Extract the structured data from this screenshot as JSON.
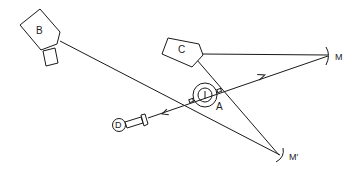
{
  "diagram": {
    "title": "",
    "components": {
      "source_b": {
        "label": "B",
        "kind": "source-housing"
      },
      "source_c": {
        "label": "C",
        "kind": "source-housing"
      },
      "sample_a": {
        "label": "A",
        "kind": "concentric-target"
      },
      "detector_d": {
        "label": "D",
        "kind": "detector"
      },
      "mirror_m": {
        "label": "M",
        "kind": "curved-mirror"
      },
      "mirror_m_prime": {
        "label": "M′",
        "kind": "curved-mirror"
      }
    },
    "beams": [
      {
        "from": "B",
        "to": "M′",
        "arrow": false
      },
      {
        "from": "C",
        "to": "M",
        "arrow": false
      },
      {
        "from": "C",
        "to": "M′",
        "arrow": false
      },
      {
        "from": "A",
        "to": "M",
        "arrow": "toward M"
      },
      {
        "from": "A",
        "to": "D",
        "arrow": "toward D"
      }
    ],
    "colors": {
      "line": "#1a1a1a",
      "background": "#ffffff"
    }
  }
}
